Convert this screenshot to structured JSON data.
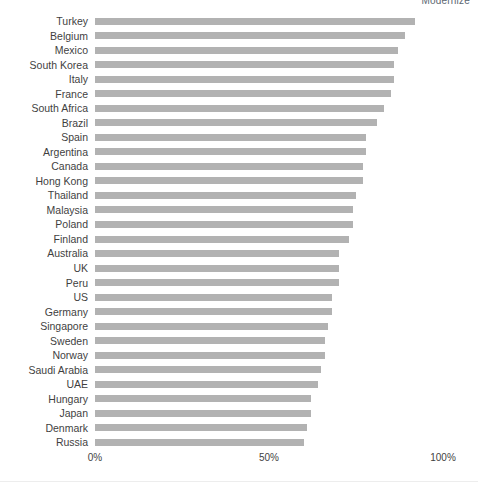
{
  "watermark": "Modernize",
  "chart_data": {
    "type": "bar",
    "orientation": "horizontal",
    "title": "",
    "subtitle": "",
    "xlabel": "",
    "ylabel": "",
    "xlim": [
      0,
      100
    ],
    "grid": false,
    "legend": "none",
    "bar_color": "#b2b2b2",
    "tick_labels": [
      "0%",
      "50%",
      "100%"
    ],
    "tick_values": [
      0,
      50,
      100
    ],
    "value_suffix": "%",
    "categories": [
      "Turkey",
      "Belgium",
      "Mexico",
      "South Korea",
      "Italy",
      "France",
      "South Africa",
      "Brazil",
      "Spain",
      "Argentina",
      "Canada",
      "Hong Kong",
      "Thailand",
      "Malaysia",
      "Poland",
      "Finland",
      "Australia",
      "UK",
      "Peru",
      "US",
      "Germany",
      "Singapore",
      "Sweden",
      "Norway",
      "Saudi Arabia",
      "UAE",
      "Hungary",
      "Japan",
      "Denmark",
      "Russia"
    ],
    "values": [
      92,
      89,
      87,
      86,
      86,
      85,
      83,
      81,
      78,
      78,
      77,
      77,
      75,
      74,
      74,
      73,
      70,
      70,
      70,
      68,
      68,
      67,
      66,
      66,
      65,
      64,
      62,
      62,
      61,
      60
    ]
  }
}
